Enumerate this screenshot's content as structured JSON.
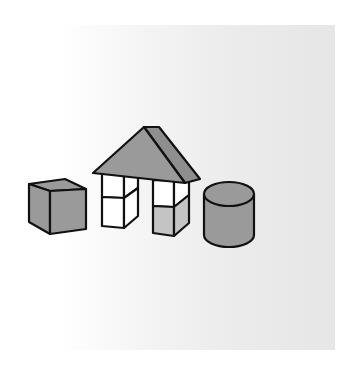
{
  "scene": {
    "description": "Toy building blocks: a cube, a house made of two pillars with a triangular prism roof, and a cylinder",
    "colors": {
      "background": "#ffffff",
      "panel_light": "#ffffff",
      "panel_dark": "#e6e6e6",
      "gray_face": "#9a9a9a",
      "light_gray_face": "#c4c4c4",
      "white_face": "#ffffff",
      "outline": "#111111"
    },
    "objects": [
      {
        "name": "cube",
        "fill": "gray"
      },
      {
        "name": "house",
        "parts": [
          "triangular-prism-roof",
          "left-pillar",
          "right-pillar"
        ]
      },
      {
        "name": "cylinder",
        "fill": "gray"
      }
    ]
  }
}
